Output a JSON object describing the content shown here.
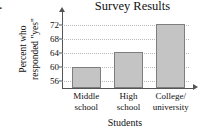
{
  "problem_number": "9.",
  "chart_data": {
    "type": "bar",
    "title": "Survey Results",
    "xlabel": "Students",
    "ylabel_lines": [
      "Percent who",
      "responded \"yes\""
    ],
    "categories": [
      "Middle school",
      "High school",
      "College/university"
    ],
    "category_lines": [
      [
        "Middle",
        "school"
      ],
      [
        "High",
        "school"
      ],
      [
        "College/",
        "university"
      ]
    ],
    "values": [
      60,
      64.2,
      72.2
    ],
    "ylim": [
      54,
      74
    ],
    "yticks": [
      72,
      68,
      64,
      60,
      56
    ],
    "ytick_labels": [
      "72",
      "68",
      "64",
      "60",
      "56"
    ],
    "grid": true,
    "legend": "none",
    "bar_fill_color": "#c4c4c4",
    "bar_border_color": "#7e7e7e",
    "axis_color": "#555555",
    "gridline_color": "#b9b9b9"
  }
}
